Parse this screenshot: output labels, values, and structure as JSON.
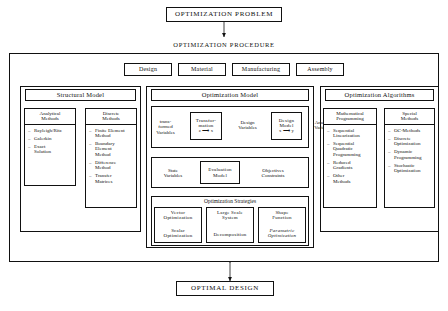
{
  "diagram": {
    "top_node": "OPTIMIZATION  PROBLEM",
    "procedure_title": "OPTIMIZATION  PROCEDURE",
    "bottom_node": "OPTIMAL  DESIGN",
    "aspect_boxes": [
      {
        "label": "Design"
      },
      {
        "label": "Material"
      },
      {
        "label": "Manufacturing"
      },
      {
        "label": "Assembly"
      }
    ],
    "columns": [
      {
        "title": "Structural  Model"
      },
      {
        "title": "Optimization  Model"
      },
      {
        "title": "Optimization  Algorithms"
      }
    ],
    "structural_model": {
      "analytical": {
        "header_line1": "Analytical",
        "header_line2": "Methods",
        "items": [
          "Rayleigh/Ritz",
          "Galerkin",
          "Exact\nSolution"
        ]
      },
      "discrete": {
        "header_line1": "Discrete",
        "header_line2": "Methods",
        "items": [
          "Finite Element\nMethod",
          "Boundary\nElement\nMethod",
          "Difference\nMethod",
          "Transfer\nMatrices"
        ]
      }
    },
    "optimization_model": {
      "row1": {
        "transformed_variables": "trans-\nformed\nVariables",
        "transformation_box": "Transfor-\nmation",
        "transformation_map": "z ⟶ x",
        "design_variables": "Design\nVariables",
        "design_model_box": "Design\nModel",
        "design_model_map": "x ⟶ y",
        "analysis_variables": "Analysis\nVariables"
      },
      "row2": {
        "state_variables": "State\nVariables",
        "evaluation_model": "Evaluation\nModel",
        "objectives_constraints": "Objectives\nConstraints"
      },
      "strategies": {
        "title": "Optimization  Strategies",
        "cells": [
          {
            "top": "Vector\nOptimization",
            "bottom": "Scalar\nOptimization"
          },
          {
            "top": "Large Scale\nSystem",
            "bottom": "Decomposition"
          },
          {
            "top": "Shape\nFunction",
            "bottom": "Parametric\nOptimization"
          }
        ]
      }
    },
    "optimization_algorithms": {
      "mathematical": {
        "header_line1": "Mathematical",
        "header_line2": "Programming",
        "items": [
          "Sequential\nLinearization",
          "Sequential\nQuadratic\nProgramming",
          "Reduced\nGradients",
          "Other\nMethods"
        ]
      },
      "special": {
        "header_line1": "Special",
        "header_line2": "Methods",
        "items": [
          "OC-Methods",
          "Discrete\nOptimization",
          "Dynamic\nProgramming",
          "Stochastic\nOptimization"
        ]
      }
    }
  }
}
